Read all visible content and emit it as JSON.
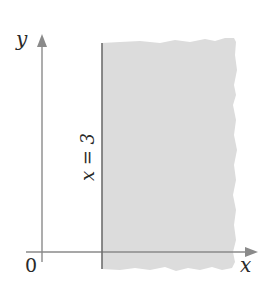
{
  "figure": {
    "axes": {
      "x_label": "x",
      "y_label": "y",
      "origin_label": "0"
    },
    "boundary_line": {
      "label": "x = 3",
      "value": 3
    },
    "colors": {
      "shade": "#dcdcdc",
      "axis": "#8a8a8a",
      "boundary": "#6e6e6e",
      "text": "#2a2a2a"
    }
  }
}
